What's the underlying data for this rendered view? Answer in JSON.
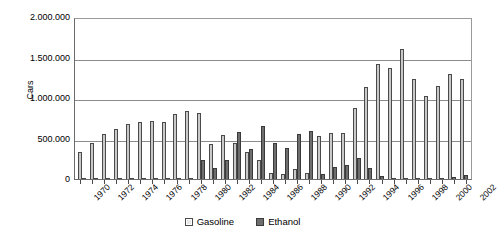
{
  "chart_data": {
    "type": "bar",
    "title": "",
    "xlabel": "",
    "ylabel": "Cars",
    "ylim": [
      0,
      2000000
    ],
    "grid": true,
    "legend_position": "bottom",
    "ytick_labels": [
      "2.000.000",
      "1.500.000",
      "1.000.000",
      "500.000",
      "0"
    ],
    "ytick_values": [
      2000000,
      1500000,
      1000000,
      500000,
      0
    ],
    "categories": [
      1970,
      1971,
      1972,
      1973,
      1974,
      1975,
      1976,
      1977,
      1978,
      1979,
      1980,
      1981,
      1982,
      1983,
      1984,
      1985,
      1986,
      1987,
      1988,
      1989,
      1990,
      1991,
      1992,
      1993,
      1994,
      1995,
      1996,
      1997,
      1998,
      1999,
      2000,
      2001,
      2002
    ],
    "xtick_labels": [
      "1970",
      "1972",
      "1974",
      "1976",
      "1978",
      "1980",
      "1982",
      "1984",
      "1986",
      "1988",
      "1990",
      "1992",
      "1994",
      "1996",
      "1998",
      "2000",
      "2002"
    ],
    "series": [
      {
        "name": "Gasoline",
        "color": "#c9c9c9",
        "values": [
          330000,
          440000,
          560000,
          620000,
          680000,
          700000,
          720000,
          700000,
          800000,
          840000,
          810000,
          430000,
          540000,
          450000,
          330000,
          230000,
          80000,
          60000,
          120000,
          80000,
          530000,
          570000,
          570000,
          880000,
          1140000,
          1420000,
          1370000,
          1610000,
          1230000,
          1020000,
          1150000,
          1300000,
          1240000
        ]
      },
      {
        "name": "Ethanol",
        "color": "#6e6e6e",
        "values": [
          0,
          0,
          0,
          0,
          0,
          0,
          0,
          0,
          0,
          0,
          240000,
          130000,
          230000,
          580000,
          370000,
          650000,
          450000,
          380000,
          560000,
          590000,
          60000,
          150000,
          170000,
          260000,
          140000,
          40000,
          10000,
          5000,
          2000,
          10000,
          10000,
          20000,
          50000
        ]
      }
    ]
  },
  "legend": {
    "items": [
      {
        "label": "Gasoline",
        "swatch": "legend-swatch-gasoline"
      },
      {
        "label": "Ethanol",
        "swatch": "legend-swatch-ethanol"
      }
    ]
  }
}
